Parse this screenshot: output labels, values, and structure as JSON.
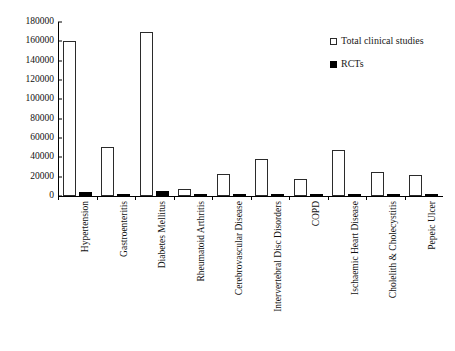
{
  "chart_data": {
    "type": "bar",
    "title": "",
    "xlabel": "",
    "ylabel": "",
    "ylim": [
      0,
      180000
    ],
    "ytick_step": 20000,
    "yticks": [
      "0",
      "20000",
      "40000",
      "60000",
      "80000",
      "100000",
      "120000",
      "140000",
      "160000",
      "180000"
    ],
    "grid": false,
    "legend_position": "top-right",
    "categories": [
      "Hypertension",
      "Gastroenteritis",
      "Diabetes Mellitus",
      "Rheumatoid Arthritis",
      "Cerebrovascular Disease",
      "Intervertebral Disc Disorders",
      "COPD",
      "Ischaemic Heart Disease",
      "Cholelith & Cholecystitis",
      "Pepeic Ulcer"
    ],
    "series": [
      {
        "name": "Total clinical studies",
        "marker": "hollow-square",
        "color": "#ffffff",
        "values": [
          160000,
          51000,
          170000,
          7000,
          23000,
          38000,
          18000,
          48000,
          25000,
          22000
        ]
      },
      {
        "name": "RCTs",
        "marker": "filled-square",
        "color": "#000000",
        "values": [
          4500,
          1600,
          5000,
          400,
          700,
          800,
          500,
          900,
          600,
          500
        ]
      }
    ]
  }
}
